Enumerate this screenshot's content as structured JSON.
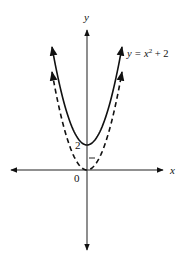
{
  "chart_data": {
    "type": "line",
    "title": "",
    "xlabel": "x",
    "ylabel": "y",
    "origin_label": "0",
    "y_tick_labels": [
      "2"
    ],
    "y_ticks": [
      1,
      2
    ],
    "series": [
      {
        "name": "y = x^2 + 2",
        "style": "solid",
        "equation": "y = x^2 + 2",
        "x": [
          -2.8,
          -2,
          -1,
          0,
          1,
          2,
          2.8
        ],
        "y": [
          9.84,
          6,
          3,
          2,
          3,
          6,
          9.84
        ]
      },
      {
        "name": "y = x^2",
        "style": "dashed",
        "equation": "y = x^2",
        "x": [
          -2.8,
          -2,
          -1,
          0,
          1,
          2,
          2.8
        ],
        "y": [
          7.84,
          4,
          1,
          0,
          1,
          4,
          7.84
        ]
      }
    ],
    "annotations": [
      {
        "text_prefix": "y = x",
        "superscript": "2",
        "text_suffix": " + 2",
        "attached_to": "y = x^2 + 2"
      }
    ],
    "grid": false,
    "legend": "none"
  }
}
